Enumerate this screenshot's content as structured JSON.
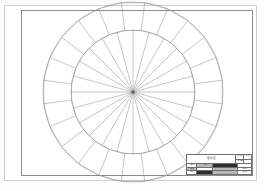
{
  "sheet": {
    "label": "engineering-drawing-sheet",
    "background_color": "#ffffff",
    "border_color": "#8b8b8b",
    "line_color": "#8a8a8a"
  },
  "drawing": {
    "name": "circular-wheel-part",
    "center_x": 133,
    "center_y": 92,
    "outer_radius": 90,
    "inner_radius": 62,
    "spoke_count": 24,
    "outer_segment_count": 24,
    "segment_offset_deg": 7.5
  },
  "title_block": {
    "title": "零件图",
    "top_right": {
      "row1_label": "比例",
      "row1_value": "1:1",
      "row2_label": "重量",
      "row2_value": ""
    },
    "rows": [
      {
        "label": "设计",
        "mid": "日期",
        "wide": "材料",
        "end": ""
      },
      {
        "label": "审核",
        "mid": "",
        "wide": "",
        "end": "共1张"
      },
      {
        "label": "工艺",
        "mid": "",
        "wide": "",
        "end": "第1张"
      }
    ]
  }
}
